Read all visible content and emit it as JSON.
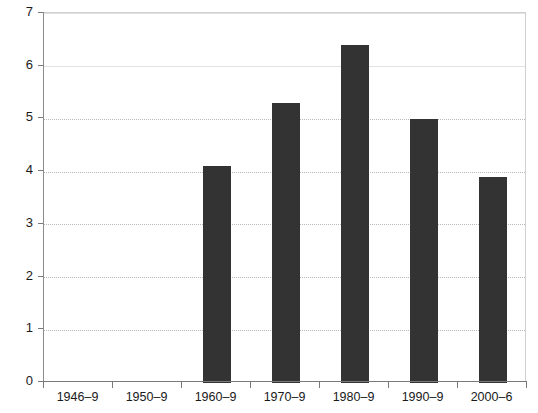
{
  "chart_data": {
    "type": "bar",
    "title": "",
    "subtitle": "",
    "xlabel": "",
    "ylabel": "",
    "categories": [
      "1946–9",
      "1950–9",
      "1960–9",
      "1970–9",
      "1980–9",
      "1990–9",
      "2000–6"
    ],
    "values": [
      0,
      0,
      4.1,
      5.3,
      6.4,
      5.0,
      3.9
    ],
    "series": [
      {
        "name": "",
        "values": [
          0,
          0,
          4.1,
          5.3,
          6.4,
          5.0,
          3.9
        ]
      }
    ],
    "ylim": [
      0,
      7
    ],
    "xlim": [
      0,
      7
    ],
    "ytick_labels": [
      "0",
      "1",
      "2",
      "3",
      "4",
      "5",
      "6",
      "7"
    ],
    "ytick_values": [
      0,
      1,
      2,
      3,
      4,
      5,
      6,
      7
    ],
    "grid": true,
    "grid_axis": "y",
    "legend": false,
    "legend_position": "none",
    "annotations": [],
    "colors": {
      "bar": "#333333",
      "grid": "#b8b8b8",
      "axis": "#7a7a7a",
      "border": "#cfcfcf",
      "text": "#1a1a1a",
      "background": "#ffffff"
    }
  }
}
